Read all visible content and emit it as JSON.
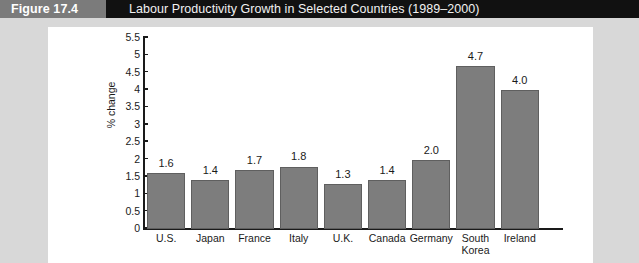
{
  "header": {
    "figure_tag": "Figure 17.4",
    "title": "Labour Productivity Growth in Selected Countries (1989–2000)",
    "tag_bg": "#7b7b7b",
    "band_bg": "#111111"
  },
  "chart_data": {
    "type": "bar",
    "title": "Labour Productivity Growth in Selected Countries (1989–2000)",
    "xlabel": "",
    "ylabel": "% change",
    "categories": [
      "U.S.",
      "Japan",
      "France",
      "Italy",
      "U.K.",
      "Canada",
      "Germany",
      "South Korea",
      "Ireland"
    ],
    "values": [
      1.6,
      1.4,
      1.7,
      1.8,
      1.3,
      1.4,
      2.0,
      4.7,
      4.0
    ],
    "value_labels": [
      "1.6",
      "1.4",
      "1.7",
      "1.8",
      "1.3",
      "1.4",
      "2.0",
      "4.7",
      "4.0"
    ],
    "ylim": [
      0,
      5.5
    ],
    "yticks": [
      0,
      0.5,
      1,
      1.5,
      2,
      2.5,
      3,
      3.5,
      4,
      4.5,
      5,
      5.5
    ],
    "ytick_labels": [
      "0",
      "0.5",
      "1",
      "1.5",
      "2",
      "2.5",
      "3",
      "3.5",
      "4",
      "4.5",
      "5",
      "5.5"
    ],
    "grid": false,
    "legend": null,
    "bar_color": "#7d7d7d",
    "bar_edge_color": "#5f5f5f",
    "panel_color": "#ffffff",
    "page_color": "#d8d8d8"
  }
}
